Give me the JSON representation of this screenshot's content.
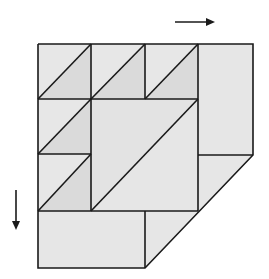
{
  "diagram": {
    "colors": {
      "background": "#ffffff",
      "light_fill": "#e6e6e6",
      "dark_fill": "#d9d9d9",
      "stroke": "#1a1a1a"
    },
    "arrows": [
      {
        "name": "arrow-right",
        "direction": "right"
      },
      {
        "name": "arrow-down",
        "direction": "down"
      }
    ]
  }
}
